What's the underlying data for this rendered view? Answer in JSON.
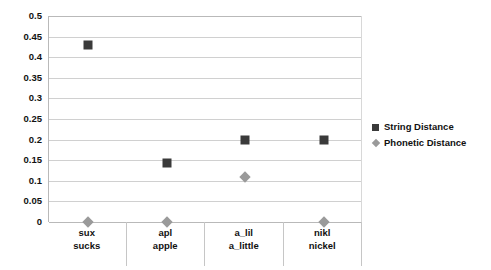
{
  "chart_data": {
    "type": "scatter",
    "title": "",
    "xlabel": "",
    "ylabel": "",
    "ylim": [
      0,
      0.5
    ],
    "ytick_step": 0.05,
    "grid": true,
    "legend_position": "right",
    "yticks": [
      "0.5",
      "0.45",
      "0.4",
      "0.35",
      "0.3",
      "0.25",
      "0.2",
      "0.15",
      "0.1",
      "0.05",
      "0"
    ],
    "ytick_values": [
      0.5,
      0.45,
      0.4,
      0.35,
      0.3,
      0.25,
      0.2,
      0.15,
      0.1,
      0.05,
      0
    ],
    "categories": [
      "sux",
      "apl",
      "a_lil",
      "nikl"
    ],
    "category_labels": [
      {
        "line1": "sux",
        "line2": "sucks"
      },
      {
        "line1": "apl",
        "line2": "apple"
      },
      {
        "line1": "a_lil",
        "line2": "a_little"
      },
      {
        "line1": "nikl",
        "line2": "nickel"
      }
    ],
    "series": [
      {
        "name": "String Distance",
        "marker": "square",
        "color": "#3a3a3a",
        "values": [
          0.43,
          0.143,
          0.2,
          0.2
        ]
      },
      {
        "name": "Phonetic Distance",
        "marker": "diamond",
        "color": "#9a9a9a",
        "values": [
          0,
          0,
          0.11,
          0
        ]
      }
    ]
  },
  "legend": {
    "items": [
      {
        "label": "String Distance",
        "marker": "square"
      },
      {
        "label": "Phonetic Distance",
        "marker": "diamond"
      }
    ]
  }
}
